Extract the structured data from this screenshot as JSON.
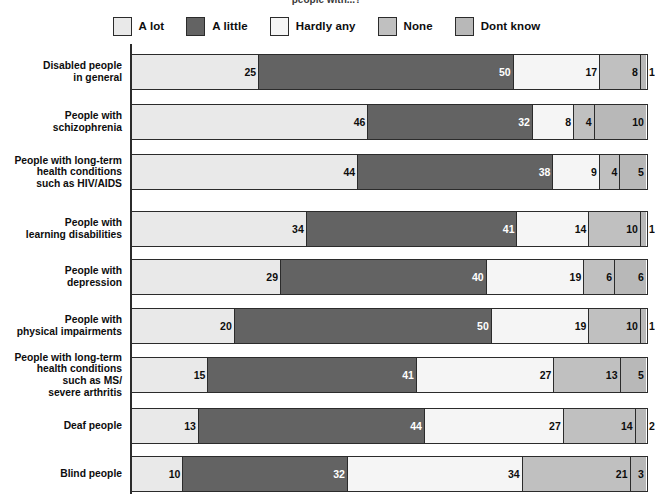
{
  "title": "people with...?",
  "legend": {
    "items": [
      {
        "label": "A lot",
        "color": "#e9e9e9"
      },
      {
        "label": "A little",
        "color": "#636363"
      },
      {
        "label": "Hardly any",
        "color": "#f5f5f5"
      },
      {
        "label": "None",
        "color": "#c0c0c0"
      },
      {
        "label": "Dont know",
        "color": "#b8b8b8"
      }
    ]
  },
  "chart_data": {
    "type": "bar",
    "orientation": "horizontal",
    "stacked": true,
    "normalized_percent": true,
    "title": "people with...?",
    "xlabel": "",
    "ylabel": "",
    "xlim": [
      0,
      100
    ],
    "grid": false,
    "legend_position": "top",
    "categories": [
      "Disabled people\nin general",
      "People with\nschizophrenia",
      "People with long-term\nhealth conditions\nsuch as HIV/AIDS",
      "People with\nlearning disabilities",
      "People with\ndepression",
      "People with\nphysical impairments",
      "People with long-term\nhealth conditions\nsuch as MS/\nsevere arthritis",
      "Deaf people",
      "Blind people"
    ],
    "series": [
      {
        "name": "A lot",
        "color": "#e9e9e9",
        "values": [
          25,
          46,
          44,
          34,
          29,
          20,
          15,
          13,
          10
        ]
      },
      {
        "name": "A little",
        "color": "#636363",
        "values": [
          50,
          32,
          38,
          41,
          40,
          50,
          41,
          44,
          32
        ]
      },
      {
        "name": "Hardly any",
        "color": "#f5f5f5",
        "values": [
          17,
          8,
          9,
          14,
          19,
          19,
          27,
          27,
          34
        ]
      },
      {
        "name": "None",
        "color": "#c0c0c0",
        "values": [
          8,
          4,
          4,
          10,
          6,
          10,
          13,
          14,
          21
        ]
      },
      {
        "name": "Dont know",
        "color": "#b8b8b8",
        "values": [
          1,
          10,
          5,
          1,
          6,
          1,
          5,
          2,
          3
        ]
      }
    ],
    "rows": [
      {
        "label": "Disabled people\nin general",
        "values": [
          25,
          50,
          17,
          8,
          1
        ],
        "total": 101,
        "label_outside": [
          false,
          false,
          false,
          false,
          true
        ]
      },
      {
        "label": "People with\nschizophrenia",
        "values": [
          46,
          32,
          8,
          4,
          10
        ],
        "total": 100,
        "label_outside": [
          false,
          false,
          false,
          false,
          false
        ]
      },
      {
        "label": "People with long-term\nhealth conditions\nsuch as HIV/AIDS",
        "values": [
          44,
          38,
          9,
          4,
          5
        ],
        "total": 100,
        "label_outside": [
          false,
          false,
          false,
          false,
          false
        ]
      },
      {
        "label": "People with\nlearning disabilities",
        "values": [
          34,
          41,
          14,
          10,
          1
        ],
        "total": 100,
        "label_outside": [
          false,
          false,
          false,
          false,
          true
        ]
      },
      {
        "label": "People with\ndepression",
        "values": [
          29,
          40,
          19,
          6,
          6
        ],
        "total": 100,
        "label_outside": [
          false,
          false,
          false,
          false,
          false
        ]
      },
      {
        "label": "People with\nphysical impairments",
        "values": [
          20,
          50,
          19,
          10,
          1
        ],
        "total": 100,
        "label_outside": [
          false,
          false,
          false,
          false,
          true
        ]
      },
      {
        "label": "People with long-term\nhealth conditions\nsuch as MS/\nsevere arthritis",
        "values": [
          15,
          41,
          27,
          13,
          5
        ],
        "total": 101,
        "label_outside": [
          false,
          false,
          false,
          false,
          false
        ]
      },
      {
        "label": "Deaf people",
        "values": [
          13,
          44,
          27,
          14,
          2
        ],
        "total": 100,
        "label_outside": [
          false,
          false,
          false,
          false,
          true
        ]
      },
      {
        "label": "Blind people",
        "values": [
          10,
          32,
          34,
          21,
          3
        ],
        "total": 100,
        "label_outside": [
          false,
          false,
          false,
          false,
          false
        ]
      }
    ]
  },
  "layout": {
    "axis_x": 130,
    "bar_start_x": 131,
    "bar_width_px": 514,
    "row_tops": [
      54,
      104,
      154,
      211,
      259,
      308,
      357,
      408,
      456
    ],
    "bar_height": 36
  }
}
